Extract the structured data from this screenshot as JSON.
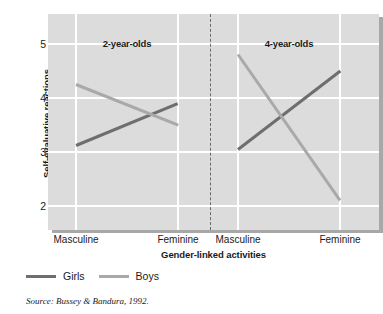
{
  "chart_data": {
    "type": "line",
    "title": "",
    "xlabel": "Gender-linked activities",
    "ylabel": "Self-evaluative reactions",
    "ylim": [
      1.55,
      5.55
    ],
    "yticks": [
      5,
      4,
      3,
      2
    ],
    "grid": true,
    "legend_position": "below-left",
    "panels": [
      {
        "label": "2-year-olds",
        "categories": [
          "Masculine",
          "Feminine"
        ],
        "series": [
          {
            "name": "Girls",
            "values": [
              3.12,
              3.9
            ],
            "color": "#6e6e6e"
          },
          {
            "name": "Boys",
            "values": [
              4.25,
              3.5
            ],
            "color": "#a9a9a9"
          }
        ]
      },
      {
        "label": "4-year-olds",
        "categories": [
          "Masculine",
          "Feminine"
        ],
        "series": [
          {
            "name": "Girls",
            "values": [
              3.05,
              4.5
            ],
            "color": "#6e6e6e"
          },
          {
            "name": "Boys",
            "values": [
              4.8,
              2.1
            ],
            "color": "#a9a9a9"
          }
        ]
      }
    ],
    "legend": [
      {
        "name": "Girls",
        "color": "#6e6e6e"
      },
      {
        "name": "Boys",
        "color": "#a9a9a9"
      }
    ]
  },
  "axis": {
    "y_title": "Self-evaluative reactions",
    "x_title": "Gender-linked activities",
    "y_tick_labels": [
      "5",
      "4",
      "3",
      "2"
    ],
    "x_tick_labels": [
      "Masculine",
      "Feminine",
      "Masculine",
      "Feminine"
    ]
  },
  "panels": {
    "left_label": "2-year-olds",
    "right_label": "4-year-olds"
  },
  "legend": {
    "girls_label": "Girls",
    "boys_label": "Boys"
  },
  "source": {
    "text": "Source: Bussey & Bandura, 1992."
  },
  "colors": {
    "plot_background": "#dcdcdc",
    "gridline": "#ffffff",
    "girls": "#6e6e6e",
    "boys": "#a9a9a9",
    "divider": "#6a6a6a",
    "shadow": "#a8a8a8"
  }
}
